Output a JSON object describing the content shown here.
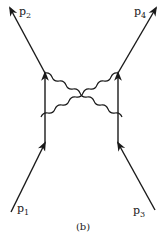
{
  "diagram": {
    "type": "feynman-diagram",
    "caption": "(b)",
    "colors": {
      "line": "#1a1a1a",
      "background": "#ffffff"
    },
    "vertices": {
      "left_top": [
        45,
        73
      ],
      "left_bottom": [
        45,
        143
      ],
      "right_top": [
        118,
        73
      ],
      "right_bottom": [
        118,
        143
      ]
    },
    "external_lines": [
      {
        "id": "p1",
        "label_main": "p",
        "label_sub": "1",
        "from": [
          11,
          212
        ],
        "to": [
          45,
          143
        ],
        "direction": "incoming"
      },
      {
        "id": "p3",
        "label_main": "p",
        "label_sub": "3",
        "from": [
          155,
          210
        ],
        "to": [
          118,
          143
        ],
        "direction": "incoming"
      },
      {
        "id": "p2",
        "label_main": "p",
        "label_sub": "2",
        "from": [
          45,
          73
        ],
        "to": [
          10,
          8
        ],
        "direction": "outgoing"
      },
      {
        "id": "p4",
        "label_main": "p",
        "label_sub": "4",
        "from": [
          118,
          73
        ],
        "to": [
          156,
          8
        ],
        "direction": "outgoing"
      }
    ],
    "internal_lines": [
      {
        "id": "left-propagator",
        "from": [
          45,
          143
        ],
        "to": [
          45,
          73
        ],
        "style": "fermion"
      },
      {
        "id": "right-propagator",
        "from": [
          118,
          143
        ],
        "to": [
          118,
          73
        ],
        "style": "fermion"
      }
    ],
    "photon_lines": [
      {
        "id": "photon-1",
        "from": [
          45,
          73
        ],
        "to": [
          118,
          143
        ],
        "style": "wavy",
        "crossed": true
      },
      {
        "id": "photon-2",
        "from": [
          118,
          73
        ],
        "to": [
          45,
          143
        ],
        "style": "wavy",
        "crossed": true
      }
    ]
  }
}
